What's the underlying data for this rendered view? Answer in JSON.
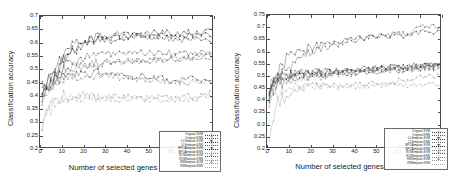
{
  "figure": {
    "background_color": "#ffffff",
    "panel_count": 2
  },
  "chart_data": [
    {
      "panel": "left",
      "type": "line",
      "title": "",
      "xlabel": "Number of selected genes",
      "ylabel": "Classification accuracy",
      "xlim": [
        0,
        80
      ],
      "ylim": [
        0.2,
        0.7
      ],
      "xticks": [
        "0",
        "10",
        "20",
        "30",
        "40",
        "50",
        "60",
        "70",
        "80"
      ],
      "yticks": [
        "0.2",
        "0.25",
        "0.3",
        "0.35",
        "0.4",
        "0.45",
        "0.5",
        "0.55",
        "0.6",
        "0.65",
        "0.7"
      ],
      "grid": false,
      "legend_position": "lower-right-inside",
      "x": [
        1,
        2,
        3,
        4,
        5,
        6,
        7,
        8,
        9,
        10,
        12,
        14,
        16,
        18,
        20,
        22,
        25,
        28,
        30,
        33,
        36,
        40,
        44,
        48,
        52,
        56,
        60,
        64,
        68,
        72,
        76,
        80
      ],
      "series": [
        {
          "name": "Original-SVM",
          "marker": "plus",
          "color": "#3a3a3a",
          "values": [
            0.43,
            0.44,
            0.455,
            0.46,
            0.47,
            0.5,
            0.52,
            0.5,
            0.52,
            0.545,
            0.555,
            0.575,
            0.6,
            0.585,
            0.595,
            0.6,
            0.615,
            0.625,
            0.615,
            0.605,
            0.61,
            0.615,
            0.625,
            0.615,
            0.62,
            0.625,
            0.615,
            0.605,
            0.61,
            0.605,
            0.615,
            0.6
          ]
        },
        {
          "name": "Original-KNN",
          "marker": "cross",
          "color": "#555555",
          "values": [
            0.42,
            0.43,
            0.44,
            0.445,
            0.45,
            0.46,
            0.47,
            0.48,
            0.49,
            0.5,
            0.515,
            0.52,
            0.53,
            0.535,
            0.54,
            0.545,
            0.55,
            0.55,
            0.555,
            0.555,
            0.56,
            0.555,
            0.555,
            0.56,
            0.56,
            0.555,
            0.56,
            0.555,
            0.56,
            0.555,
            0.56,
            0.555
          ]
        },
        {
          "name": "LLSimpute-SVM",
          "marker": "star",
          "color": "#2e2e2e",
          "values": [
            0.4,
            0.42,
            0.435,
            0.45,
            0.46,
            0.48,
            0.495,
            0.5,
            0.51,
            0.525,
            0.545,
            0.56,
            0.575,
            0.585,
            0.595,
            0.6,
            0.615,
            0.62,
            0.625,
            0.62,
            0.63,
            0.635,
            0.63,
            0.635,
            0.635,
            0.64,
            0.635,
            0.63,
            0.64,
            0.635,
            0.64,
            0.645
          ]
        },
        {
          "name": "LLSimpute-KNN",
          "marker": "square",
          "color": "#666666",
          "values": [
            0.41,
            0.42,
            0.43,
            0.44,
            0.445,
            0.455,
            0.465,
            0.47,
            0.475,
            0.485,
            0.495,
            0.5,
            0.505,
            0.51,
            0.515,
            0.515,
            0.52,
            0.52,
            0.525,
            0.525,
            0.525,
            0.53,
            0.53,
            0.535,
            0.535,
            0.535,
            0.54,
            0.54,
            0.545,
            0.545,
            0.55,
            0.555
          ]
        },
        {
          "name": "BPCAimpute-SVM",
          "marker": "filled-square",
          "color": "#1f1f1f",
          "values": [
            0.395,
            0.415,
            0.43,
            0.44,
            0.455,
            0.475,
            0.49,
            0.495,
            0.505,
            0.52,
            0.535,
            0.55,
            0.565,
            0.575,
            0.585,
            0.59,
            0.6,
            0.605,
            0.61,
            0.615,
            0.62,
            0.62,
            0.625,
            0.625,
            0.62,
            0.625,
            0.625,
            0.62,
            0.625,
            0.63,
            0.625,
            0.63
          ]
        },
        {
          "name": "BPCAimpute-KNN",
          "marker": "circle",
          "color": "#777777",
          "values": [
            0.405,
            0.415,
            0.425,
            0.43,
            0.44,
            0.45,
            0.46,
            0.465,
            0.47,
            0.48,
            0.49,
            0.495,
            0.5,
            0.505,
            0.505,
            0.51,
            0.515,
            0.515,
            0.52,
            0.52,
            0.52,
            0.525,
            0.525,
            0.53,
            0.53,
            0.53,
            0.535,
            0.535,
            0.54,
            0.54,
            0.545,
            0.545
          ]
        },
        {
          "name": "ROWimpute-SVM",
          "marker": "filled-circle",
          "color": "#444444",
          "values": [
            0.39,
            0.4,
            0.41,
            0.42,
            0.425,
            0.44,
            0.45,
            0.455,
            0.46,
            0.465,
            0.47,
            0.475,
            0.475,
            0.48,
            0.48,
            0.48,
            0.485,
            0.485,
            0.48,
            0.48,
            0.475,
            0.47,
            0.47,
            0.47,
            0.465,
            0.465,
            0.455,
            0.455,
            0.46,
            0.46,
            0.46,
            0.465
          ]
        },
        {
          "name": "ROWimpute-KNN",
          "marker": "triangle",
          "color": "#888888",
          "values": [
            0.385,
            0.395,
            0.405,
            0.415,
            0.42,
            0.43,
            0.44,
            0.445,
            0.45,
            0.455,
            0.46,
            0.465,
            0.465,
            0.47,
            0.47,
            0.47,
            0.47,
            0.47,
            0.47,
            0.47,
            0.465,
            0.465,
            0.46,
            0.46,
            0.455,
            0.45,
            0.45,
            0.445,
            0.445,
            0.45,
            0.45,
            0.45
          ]
        },
        {
          "name": "KNNimpute-SVM",
          "marker": "diamond",
          "color": "#999999",
          "values": [
            0.27,
            0.3,
            0.325,
            0.345,
            0.355,
            0.365,
            0.375,
            0.38,
            0.385,
            0.385,
            0.39,
            0.395,
            0.395,
            0.4,
            0.4,
            0.4,
            0.395,
            0.395,
            0.395,
            0.395,
            0.39,
            0.39,
            0.39,
            0.39,
            0.39,
            0.39,
            0.39,
            0.39,
            0.395,
            0.395,
            0.4,
            0.405
          ]
        },
        {
          "name": "KNNimpute-KNN",
          "marker": "dot",
          "color": "#b0b0b0",
          "values": [
            0.255,
            0.285,
            0.31,
            0.33,
            0.34,
            0.35,
            0.36,
            0.365,
            0.37,
            0.375,
            0.38,
            0.385,
            0.385,
            0.39,
            0.39,
            0.39,
            0.385,
            0.385,
            0.385,
            0.385,
            0.38,
            0.38,
            0.38,
            0.38,
            0.38,
            0.38,
            0.38,
            0.38,
            0.385,
            0.385,
            0.39,
            0.395
          ]
        }
      ]
    },
    {
      "panel": "right",
      "type": "line",
      "title": "",
      "xlabel": "Number of selected genes",
      "ylabel": "Classification accuracy",
      "xlim": [
        0,
        80
      ],
      "ylim": [
        0.2,
        0.75
      ],
      "xticks": [
        "0",
        "10",
        "20",
        "30",
        "40",
        "50",
        "60",
        "70",
        "80"
      ],
      "yticks": [
        "0.2",
        "0.25",
        "0.3",
        "0.35",
        "0.4",
        "0.45",
        "0.5",
        "0.55",
        "0.6",
        "0.65",
        "0.7",
        "0.75"
      ],
      "grid": false,
      "legend_position": "lower-right-inside",
      "x": [
        1,
        2,
        3,
        4,
        5,
        6,
        7,
        8,
        9,
        10,
        12,
        14,
        16,
        18,
        20,
        22,
        25,
        28,
        30,
        33,
        36,
        40,
        44,
        48,
        52,
        56,
        60,
        64,
        68,
        72,
        76,
        80
      ],
      "series": [
        {
          "name": "Original-SVM",
          "marker": "plus",
          "color": "#3a3a3a",
          "values": [
            0.4,
            0.445,
            0.46,
            0.485,
            0.5,
            0.52,
            0.545,
            0.555,
            0.565,
            0.575,
            0.595,
            0.6,
            0.615,
            0.605,
            0.615,
            0.615,
            0.625,
            0.63,
            0.635,
            0.64,
            0.645,
            0.655,
            0.655,
            0.66,
            0.665,
            0.66,
            0.67,
            0.665,
            0.675,
            0.68,
            0.675,
            0.685
          ]
        },
        {
          "name": "Original-KNN",
          "marker": "cross",
          "color": "#555555",
          "values": [
            0.41,
            0.455,
            0.47,
            0.485,
            0.495,
            0.505,
            0.515,
            0.525,
            0.53,
            0.54,
            0.555,
            0.565,
            0.575,
            0.585,
            0.59,
            0.6,
            0.61,
            0.615,
            0.62,
            0.625,
            0.635,
            0.645,
            0.65,
            0.655,
            0.66,
            0.665,
            0.67,
            0.675,
            0.685,
            0.7,
            0.705,
            0.695
          ]
        },
        {
          "name": "LLSimpute-SVM",
          "marker": "star",
          "color": "#2e2e2e",
          "values": [
            0.415,
            0.455,
            0.47,
            0.48,
            0.485,
            0.49,
            0.495,
            0.5,
            0.5,
            0.505,
            0.505,
            0.505,
            0.51,
            0.51,
            0.51,
            0.51,
            0.515,
            0.515,
            0.515,
            0.52,
            0.52,
            0.525,
            0.525,
            0.53,
            0.53,
            0.535,
            0.535,
            0.535,
            0.54,
            0.54,
            0.545,
            0.545
          ]
        },
        {
          "name": "LLSimpute-KNN",
          "marker": "square",
          "color": "#666666",
          "values": [
            0.41,
            0.45,
            0.465,
            0.475,
            0.48,
            0.485,
            0.49,
            0.495,
            0.495,
            0.5,
            0.5,
            0.505,
            0.505,
            0.505,
            0.505,
            0.51,
            0.51,
            0.51,
            0.515,
            0.515,
            0.515,
            0.52,
            0.52,
            0.525,
            0.53,
            0.53,
            0.535,
            0.535,
            0.535,
            0.54,
            0.54,
            0.545
          ]
        },
        {
          "name": "BPCAimpute-SVM",
          "marker": "filled-square",
          "color": "#1f1f1f",
          "values": [
            0.405,
            0.445,
            0.46,
            0.47,
            0.48,
            0.485,
            0.49,
            0.49,
            0.495,
            0.495,
            0.5,
            0.5,
            0.505,
            0.505,
            0.505,
            0.505,
            0.51,
            0.51,
            0.51,
            0.515,
            0.515,
            0.52,
            0.52,
            0.525,
            0.525,
            0.53,
            0.53,
            0.53,
            0.535,
            0.535,
            0.54,
            0.54
          ]
        },
        {
          "name": "BPCAimpute-KNN",
          "marker": "circle",
          "color": "#777777",
          "values": [
            0.4,
            0.44,
            0.455,
            0.465,
            0.475,
            0.48,
            0.485,
            0.49,
            0.49,
            0.495,
            0.495,
            0.5,
            0.5,
            0.5,
            0.505,
            0.505,
            0.505,
            0.505,
            0.51,
            0.51,
            0.51,
            0.515,
            0.515,
            0.52,
            0.52,
            0.525,
            0.525,
            0.53,
            0.53,
            0.535,
            0.535,
            0.54
          ]
        },
        {
          "name": "ROWimpute-SVM",
          "marker": "filled-circle",
          "color": "#444444",
          "values": [
            0.395,
            0.43,
            0.445,
            0.455,
            0.465,
            0.47,
            0.475,
            0.48,
            0.485,
            0.485,
            0.49,
            0.49,
            0.495,
            0.495,
            0.495,
            0.5,
            0.5,
            0.5,
            0.505,
            0.505,
            0.505,
            0.51,
            0.51,
            0.515,
            0.515,
            0.52,
            0.52,
            0.525,
            0.525,
            0.53,
            0.53,
            0.535
          ]
        },
        {
          "name": "ROWimpute-KNN",
          "marker": "triangle",
          "color": "#888888",
          "values": [
            0.39,
            0.425,
            0.44,
            0.45,
            0.46,
            0.465,
            0.47,
            0.475,
            0.48,
            0.48,
            0.485,
            0.485,
            0.49,
            0.49,
            0.495,
            0.495,
            0.495,
            0.5,
            0.5,
            0.5,
            0.505,
            0.505,
            0.51,
            0.51,
            0.515,
            0.515,
            0.52,
            0.52,
            0.525,
            0.525,
            0.53,
            0.53
          ]
        },
        {
          "name": "KNNimpute-SVM",
          "marker": "diamond",
          "color": "#999999",
          "values": [
            0.23,
            0.29,
            0.325,
            0.355,
            0.375,
            0.39,
            0.4,
            0.41,
            0.42,
            0.425,
            0.435,
            0.44,
            0.445,
            0.45,
            0.45,
            0.45,
            0.455,
            0.455,
            0.455,
            0.455,
            0.46,
            0.46,
            0.465,
            0.465,
            0.47,
            0.47,
            0.475,
            0.48,
            0.485,
            0.49,
            0.495,
            0.5
          ]
        },
        {
          "name": "KNNimpute-KNN",
          "marker": "dot",
          "color": "#b0b0b0",
          "values": [
            0.385,
            0.41,
            0.42,
            0.43,
            0.435,
            0.44,
            0.445,
            0.445,
            0.45,
            0.45,
            0.45,
            0.45,
            0.45,
            0.45,
            0.45,
            0.45,
            0.45,
            0.45,
            0.45,
            0.45,
            0.45,
            0.45,
            0.455,
            0.455,
            0.455,
            0.455,
            0.455,
            0.455,
            0.46,
            0.46,
            0.46,
            0.46
          ]
        }
      ]
    }
  ]
}
